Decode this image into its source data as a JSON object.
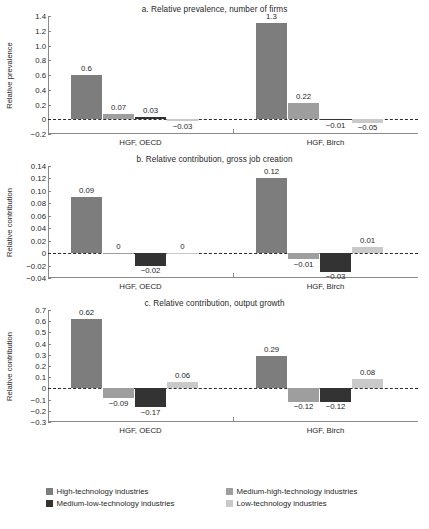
{
  "chart_data": [
    {
      "type": "bar",
      "panel": "a",
      "title": "a. Relative prevalence, number of firms",
      "xlabel": "",
      "ylabel": "Relative prevalence",
      "ylim": [
        -0.2,
        1.4
      ],
      "yticks": [
        "1.4",
        "1.2",
        "1.0",
        "0.8",
        "0.6",
        "0.4",
        "0.2",
        "0",
        "-0.2"
      ],
      "ytick_values": [
        1.4,
        1.2,
        1.0,
        0.8,
        0.6,
        0.4,
        0.2,
        0,
        -0.2
      ],
      "grid": false,
      "categories": [
        "HGF, OECD",
        "HGF, Birch"
      ],
      "series": [
        {
          "name": "High-technology industries",
          "values": [
            0.6,
            1.3
          ],
          "labels": [
            "0.6",
            "1.3"
          ]
        },
        {
          "name": "Medium-high-technology industries",
          "values": [
            0.07,
            0.22
          ],
          "labels": [
            "0.07",
            "0.22"
          ]
        },
        {
          "name": "Medium-low-technology industries",
          "values": [
            0.03,
            -0.01
          ],
          "labels": [
            "0.03",
            "-0.01"
          ]
        },
        {
          "name": "Low-technology industries",
          "values": [
            -0.03,
            -0.05
          ],
          "labels": [
            "-0.03",
            "-0.05"
          ]
        }
      ]
    },
    {
      "type": "bar",
      "panel": "b",
      "title": "b. Relative contribution, gross job creation",
      "xlabel": "",
      "ylabel": "Relative contribution",
      "ylim": [
        -0.04,
        0.14
      ],
      "yticks": [
        "0.14",
        "0.12",
        "0.10",
        "0.08",
        "0.06",
        "0.04",
        "0.02",
        "0",
        "-0.02",
        "-0.04"
      ],
      "ytick_values": [
        0.14,
        0.12,
        0.1,
        0.08,
        0.06,
        0.04,
        0.02,
        0,
        -0.02,
        -0.04
      ],
      "grid": false,
      "categories": [
        "HGF, OECD",
        "HGF, Birch"
      ],
      "series": [
        {
          "name": "High-technology industries",
          "values": [
            0.09,
            0.12
          ],
          "labels": [
            "0.09",
            "0.12"
          ]
        },
        {
          "name": "Medium-high-technology industries",
          "values": [
            0,
            -0.01
          ],
          "labels": [
            "0",
            "-0.01"
          ]
        },
        {
          "name": "Medium-low-technology industries",
          "values": [
            -0.02,
            -0.03
          ],
          "labels": [
            "-0.02",
            "-0.03"
          ]
        },
        {
          "name": "Low-technology industries",
          "values": [
            0,
            0.01
          ],
          "labels": [
            "0",
            "0.01"
          ]
        }
      ]
    },
    {
      "type": "bar",
      "panel": "c",
      "title": "c. Relative contribution, output growth",
      "xlabel": "",
      "ylabel": "Relative contribution",
      "ylim": [
        -0.3,
        0.7
      ],
      "yticks": [
        "0.7",
        "0.6",
        "0.5",
        "0.4",
        "0.3",
        "0.2",
        "0.1",
        "0",
        "-0.1",
        "-0.2",
        "-0.3"
      ],
      "ytick_values": [
        0.7,
        0.6,
        0.5,
        0.4,
        0.3,
        0.2,
        0.1,
        0,
        -0.1,
        -0.2,
        -0.3
      ],
      "grid": false,
      "categories": [
        "HGF, OECD",
        "HGF, Birch"
      ],
      "series": [
        {
          "name": "High-technology industries",
          "values": [
            0.62,
            0.29
          ],
          "labels": [
            "0.62",
            "0.29"
          ]
        },
        {
          "name": "Medium-high-technology industries",
          "values": [
            -0.09,
            -0.12
          ],
          "labels": [
            "-0.09",
            "-0.12"
          ]
        },
        {
          "name": "Medium-low-technology industries",
          "values": [
            -0.17,
            -0.12
          ],
          "labels": [
            "-0.17",
            "-0.12"
          ]
        },
        {
          "name": "Low-technology industries",
          "values": [
            0.06,
            0.08
          ],
          "labels": [
            "0.06",
            "0.08"
          ]
        }
      ]
    }
  ],
  "legend": {
    "position": "bottom",
    "items": [
      {
        "label": "High-technology industries",
        "color": "#7d7d7d",
        "key": "high"
      },
      {
        "label": "Medium-high-technology industries",
        "color": "#9e9e9e",
        "key": "medhigh"
      },
      {
        "label": "Medium-low-technology industries",
        "color": "#333333",
        "key": "medlow"
      },
      {
        "label": "Low-technology industries",
        "color": "#c9c9c9",
        "key": "low"
      }
    ]
  },
  "colors": {
    "high": "#7d7d7d",
    "medhigh": "#9e9e9e",
    "medlow": "#333333",
    "low": "#c9c9c9",
    "axis": "#8a8a8a",
    "text": "#1f1f1f"
  }
}
